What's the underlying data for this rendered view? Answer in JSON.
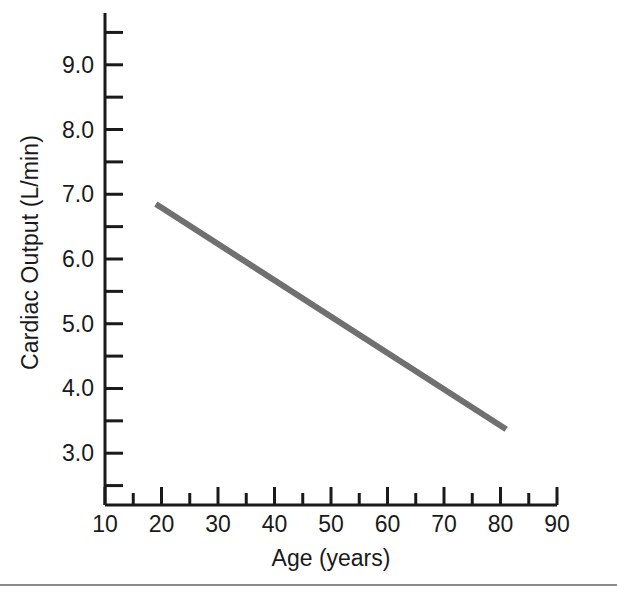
{
  "figure": {
    "background_color": "#ffffff",
    "axis_color": "#1a1a1a",
    "series_color": "#707070",
    "rule_color": "#8a8a8a"
  },
  "chart_data": {
    "type": "line",
    "title": "",
    "xlabel": "Age (years)",
    "ylabel": "Cardiac Output (L/min)",
    "xlim": [
      10,
      90
    ],
    "ylim": [
      2.2,
      9.8
    ],
    "grid": false,
    "legend": null,
    "x_major_ticks": [
      10,
      20,
      30,
      40,
      50,
      60,
      70,
      80,
      90
    ],
    "x_minor_ticks": [
      15,
      25,
      35,
      45,
      55,
      65,
      75,
      85
    ],
    "x_tick_labels": [
      "10",
      "20",
      "30",
      "40",
      "50",
      "60",
      "70",
      "80",
      "90"
    ],
    "y_major_ticks": [
      3.0,
      4.0,
      5.0,
      6.0,
      7.0,
      8.0,
      9.0
    ],
    "y_minor_ticks": [
      2.5,
      3.5,
      4.5,
      5.5,
      6.5,
      7.5,
      8.5,
      9.5
    ],
    "y_tick_labels": [
      "3.0",
      "4.0",
      "5.0",
      "6.0",
      "7.0",
      "8.0",
      "9.0"
    ],
    "series": [
      {
        "name": "Cardiac output vs age",
        "x": [
          19,
          81
        ],
        "values": [
          6.85,
          3.37
        ],
        "line_width": 6,
        "color": "#707070"
      }
    ]
  }
}
